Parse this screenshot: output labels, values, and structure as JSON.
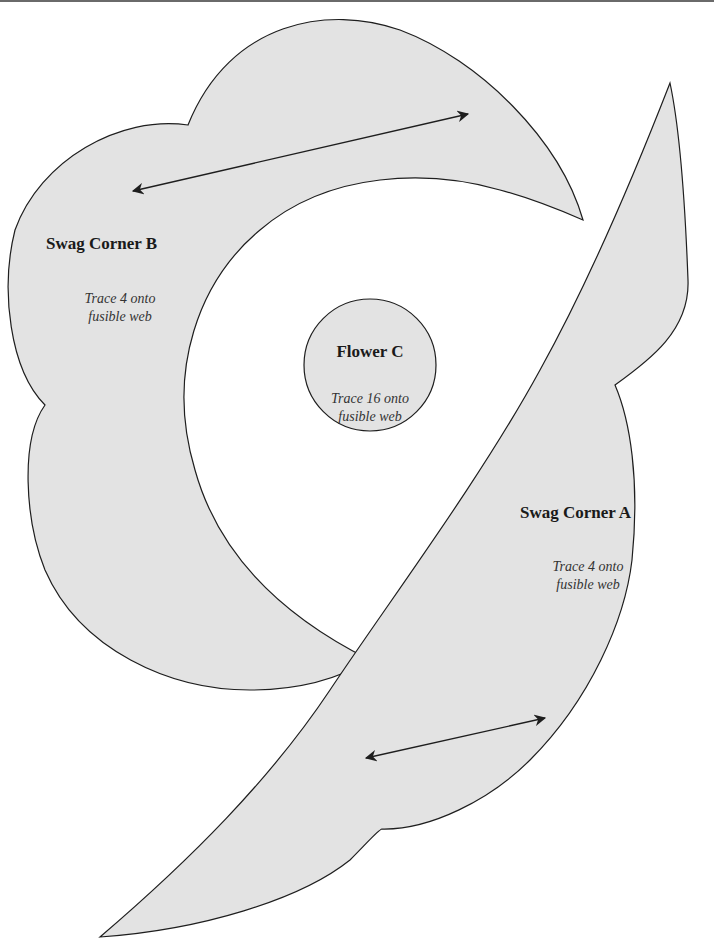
{
  "colors": {
    "fill": "#e3e3e3",
    "stroke": "#1e1e1e",
    "rule": "#6a6a6a",
    "background": "#ffffff"
  },
  "pieces": {
    "swag_b": {
      "title": "Swag Corner B",
      "note_line1": "Trace 4 onto",
      "note_line2": "fusible web",
      "grain_arrow": "double-headed"
    },
    "flower_c": {
      "title": "Flower C",
      "note_line1": "Trace 16 onto",
      "note_line2": "fusible web"
    },
    "swag_a": {
      "title": "Swag Corner A",
      "note_line1": "Trace 4 onto",
      "note_line2": "fusible web",
      "grain_arrow": "double-headed"
    }
  }
}
